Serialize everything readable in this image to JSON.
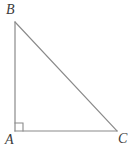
{
  "figure": {
    "kind": "right-triangle-diagram",
    "background_color": "#ffffff",
    "stroke_color": "#8a8a8a",
    "label_color": "#3a3a3a",
    "stroke_width": 1.2,
    "canvas": {
      "width": 135,
      "height": 152
    }
  },
  "vertices": {
    "A": {
      "label": "A",
      "x": 15,
      "y": 131,
      "role": "right-angle-vertex"
    },
    "B": {
      "label": "B",
      "x": 15,
      "y": 22,
      "role": "apex-top"
    },
    "C": {
      "label": "C",
      "x": 117,
      "y": 131,
      "role": "apex-right"
    }
  },
  "sides": [
    {
      "name": "AB",
      "from": "A",
      "to": "B",
      "orientation": "vertical"
    },
    {
      "name": "AC",
      "from": "A",
      "to": "C",
      "orientation": "horizontal"
    },
    {
      "name": "BC",
      "from": "B",
      "to": "C",
      "orientation": "hypotenuse"
    }
  ],
  "markers": {
    "right_angle": {
      "at": "A",
      "symbol": "square",
      "size": 8,
      "description": "right-angle-square-marker"
    }
  }
}
